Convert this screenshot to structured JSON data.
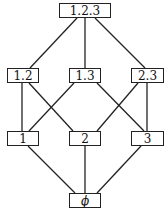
{
  "diagram": {
    "type": "hasse-lattice",
    "nodes": [
      {
        "id": "n123",
        "label": "1.2.3",
        "x": 59,
        "y": 3,
        "w": 52,
        "h": 15
      },
      {
        "id": "n12",
        "label": "1.2",
        "x": 7,
        "y": 68,
        "w": 32,
        "h": 15
      },
      {
        "id": "n13",
        "label": "1.3",
        "x": 69,
        "y": 68,
        "w": 32,
        "h": 15
      },
      {
        "id": "n23",
        "label": "2.3",
        "x": 131,
        "y": 68,
        "w": 33,
        "h": 15
      },
      {
        "id": "n1",
        "label": "1",
        "x": 7,
        "y": 131,
        "w": 32,
        "h": 15
      },
      {
        "id": "n2",
        "label": "2",
        "x": 69,
        "y": 131,
        "w": 32,
        "h": 15
      },
      {
        "id": "n3",
        "label": "3",
        "x": 131,
        "y": 131,
        "w": 33,
        "h": 15
      },
      {
        "id": "nphi",
        "label": "ϕ",
        "x": 69,
        "y": 193,
        "w": 32,
        "h": 15
      }
    ],
    "edges": [
      {
        "from": "n123",
        "to": "n12",
        "x1": 77,
        "y1": 18,
        "x2": 30,
        "y2": 68
      },
      {
        "from": "n123",
        "to": "n13",
        "x1": 85,
        "y1": 18,
        "x2": 85,
        "y2": 68
      },
      {
        "from": "n123",
        "to": "n23",
        "x1": 95,
        "y1": 18,
        "x2": 145,
        "y2": 68
      },
      {
        "from": "n12",
        "to": "n1",
        "x1": 22,
        "y1": 83,
        "x2": 22,
        "y2": 131
      },
      {
        "from": "n12",
        "to": "n2",
        "x1": 29,
        "y1": 83,
        "x2": 73,
        "y2": 131
      },
      {
        "from": "n13",
        "to": "n1",
        "x1": 74,
        "y1": 83,
        "x2": 29,
        "y2": 131
      },
      {
        "from": "n13",
        "to": "n3",
        "x1": 97,
        "y1": 83,
        "x2": 144,
        "y2": 131
      },
      {
        "from": "n23",
        "to": "n2",
        "x1": 138,
        "y1": 83,
        "x2": 97,
        "y2": 131
      },
      {
        "from": "n23",
        "to": "n3",
        "x1": 147,
        "y1": 83,
        "x2": 147,
        "y2": 131
      },
      {
        "from": "n1",
        "to": "nphi",
        "x1": 28,
        "y1": 146,
        "x2": 75,
        "y2": 193
      },
      {
        "from": "n2",
        "to": "nphi",
        "x1": 85,
        "y1": 146,
        "x2": 85,
        "y2": 193
      },
      {
        "from": "n3",
        "to": "nphi",
        "x1": 141,
        "y1": 146,
        "x2": 97,
        "y2": 193
      }
    ]
  },
  "labels": {
    "n123": "1.2.3",
    "n12": "1.2",
    "n13": "1.3",
    "n23": "2.3",
    "n1": "1",
    "n2": "2",
    "n3": "3",
    "nphi": "ϕ"
  }
}
